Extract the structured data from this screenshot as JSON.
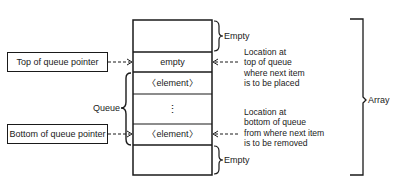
{
  "diagram": {
    "type": "queue-in-array",
    "array": {
      "label": "Array",
      "cells": [
        {
          "id": "top-empty-area",
          "text": ""
        },
        {
          "id": "next-insert-slot",
          "text": "empty"
        },
        {
          "id": "top-element",
          "text": "〈element〉"
        },
        {
          "id": "ellipsis",
          "text": "⋮"
        },
        {
          "id": "bottom-element",
          "text": "〈element〉"
        },
        {
          "id": "bottom-empty-area",
          "text": ""
        }
      ]
    },
    "braces": {
      "top_empty": "Empty",
      "bottom_empty": "Empty",
      "queue": "Queue"
    },
    "pointers": {
      "top": "Top of queue pointer",
      "bottom": "Bottom of queue pointer"
    },
    "notes": {
      "top": [
        "Location at",
        "top of queue",
        "where next item",
        "is to be placed"
      ],
      "bottom": [
        "Location at",
        "bottom of queue",
        "from where next item",
        "is to be removed"
      ]
    }
  }
}
